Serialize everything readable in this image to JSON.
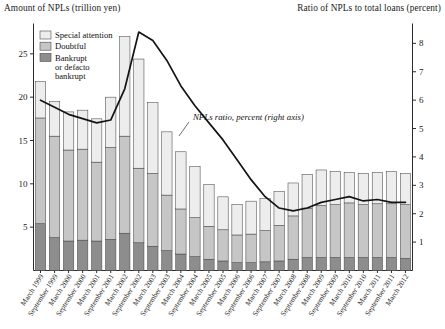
{
  "header": {
    "left_title": "Amount of NPLs (trillion yen)",
    "right_title": "Ratio of NPLs to total loans (percent)"
  },
  "legend": {
    "items": [
      {
        "label": "Special attention",
        "color": "#ededed"
      },
      {
        "label": "Doubtful",
        "color": "#c6c6c6"
      },
      {
        "label": "Bankrupt or defacto bankrupt",
        "color": "#8d8d8d"
      }
    ],
    "line1": "Bankrupt",
    "line2": "or defacto",
    "line3": "bankrupt"
  },
  "annotation": {
    "text": "NPLs ratio, percent (right axis)"
  },
  "chart_data": {
    "type": "bar",
    "title": "Amount of NPLs (trillion yen)",
    "xlabel": "",
    "ylabel": "Amount of NPLs (trillion yen)",
    "y2label": "Ratio of NPLs to total loans (percent)",
    "ylim": [
      0,
      28.5
    ],
    "y2lim": [
      0,
      8.7
    ],
    "yticks": [
      5,
      10,
      15,
      20,
      25
    ],
    "y2ticks": [
      1,
      2,
      3,
      4,
      5,
      6,
      7,
      8
    ],
    "grid": false,
    "legend_position": "top-left",
    "categories": [
      "March 1999",
      "September 1999",
      "March 2000",
      "September 2000",
      "March 2001",
      "September 2001",
      "March 2002",
      "September 2002",
      "March 2003",
      "September 2003",
      "March 2004",
      "September 2004",
      "March 2005",
      "September 2005",
      "March 2006",
      "September 2006",
      "March 2007",
      "September 2007",
      "March 2008",
      "September 2008",
      "March 2009",
      "September 2009",
      "March 2010",
      "September 2010",
      "March 2011",
      "September 2011",
      "March 2012"
    ],
    "stacked": true,
    "series": [
      {
        "name": "Bankrupt or defacto bankrupt",
        "color": "#8d8d8d",
        "values": [
          5.4,
          3.8,
          3.4,
          3.5,
          3.4,
          3.6,
          4.3,
          3.2,
          2.8,
          2.3,
          1.9,
          1.6,
          1.3,
          1.1,
          0.9,
          0.9,
          1.0,
          1.1,
          1.3,
          1.5,
          1.5,
          1.5,
          1.5,
          1.5,
          1.5,
          1.5,
          1.4
        ]
      },
      {
        "name": "Doubtful",
        "color": "#c6c6c6",
        "values": [
          12.2,
          11.7,
          10.5,
          10.5,
          9.1,
          10.6,
          11.2,
          8.6,
          8.4,
          6.4,
          5.2,
          4.5,
          3.8,
          3.6,
          3.2,
          3.3,
          3.6,
          4.1,
          5.0,
          5.7,
          6.0,
          6.1,
          6.3,
          6.1,
          6.2,
          6.2,
          6.2
        ]
      },
      {
        "name": "Special attention",
        "color": "#ededed",
        "values": [
          4.2,
          4.0,
          4.4,
          4.5,
          5.0,
          5.8,
          11.5,
          12.6,
          8.2,
          7.3,
          6.6,
          5.9,
          4.8,
          3.8,
          3.5,
          3.8,
          3.7,
          3.9,
          3.8,
          3.9,
          4.1,
          3.8,
          3.5,
          3.6,
          3.6,
          3.7,
          3.6
        ]
      }
    ],
    "totals": [
      21.8,
      19.5,
      18.3,
      18.5,
      17.5,
      20.0,
      27.0,
      24.4,
      19.4,
      16.0,
      13.7,
      12.0,
      9.9,
      8.5,
      7.6,
      8.0,
      8.3,
      9.1,
      10.1,
      11.1,
      11.6,
      11.4,
      11.3,
      11.2,
      11.3,
      11.4,
      11.2
    ],
    "line_series": {
      "name": "NPLs ratio, percent (right axis)",
      "axis": "right",
      "color": "#141414",
      "values": [
        6.0,
        5.75,
        5.5,
        5.35,
        5.2,
        5.3,
        6.4,
        8.4,
        8.1,
        7.4,
        6.5,
        5.8,
        5.2,
        4.6,
        3.9,
        3.2,
        2.6,
        2.2,
        2.1,
        2.2,
        2.4,
        2.5,
        2.6,
        2.45,
        2.5,
        2.4,
        2.4
      ]
    }
  }
}
